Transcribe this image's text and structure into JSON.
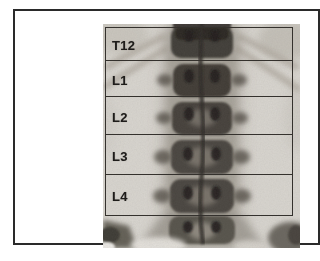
{
  "figure": {
    "regions": [
      {
        "label": "T12"
      },
      {
        "label": "L1"
      },
      {
        "label": "L2"
      },
      {
        "label": "L3"
      },
      {
        "label": "L4"
      }
    ],
    "colors": {
      "page_background": "#ffffff",
      "frame_border": "#2a2a2a",
      "grid_line": "#34312d",
      "label_text": "#1e1c1a",
      "scan_background": "#d9d6d0",
      "bone_dark": "#433f39"
    }
  }
}
